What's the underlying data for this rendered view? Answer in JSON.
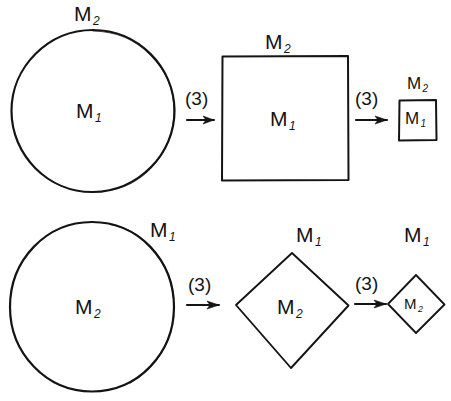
{
  "figure": {
    "type": "hand-drawn-shape-transformation-diagram",
    "background_color": "#ffffff",
    "ink_color": "#141414",
    "width": 451,
    "height": 401
  },
  "rows": [
    {
      "id": "row-1",
      "nodes": [
        {
          "shape": "circle",
          "size": "large",
          "inner_label_base": "M",
          "inner_label_sub": "1",
          "outer_label_base": "M",
          "outer_label_sub": "2",
          "outer_label_position": "top"
        },
        {
          "shape": "square",
          "size": "large",
          "inner_label_base": "M",
          "inner_label_sub": "1",
          "outer_label_base": "M",
          "outer_label_sub": "2",
          "outer_label_position": "top"
        },
        {
          "shape": "square",
          "size": "small",
          "inner_label_base": "M",
          "inner_label_sub": "1",
          "outer_label_base": "M",
          "outer_label_sub": "2",
          "outer_label_position": "top"
        }
      ],
      "arrows": [
        {
          "label": "(3)"
        },
        {
          "label": "(3)"
        }
      ]
    },
    {
      "id": "row-2",
      "nodes": [
        {
          "shape": "circle",
          "size": "large",
          "inner_label_base": "M",
          "inner_label_sub": "2",
          "outer_label_base": "M",
          "outer_label_sub": "1",
          "outer_label_position": "top-right"
        },
        {
          "shape": "diamond",
          "size": "large",
          "inner_label_base": "M",
          "inner_label_sub": "2",
          "outer_label_base": "M",
          "outer_label_sub": "1",
          "outer_label_position": "top"
        },
        {
          "shape": "diamond",
          "size": "small",
          "inner_label_base": "M",
          "inner_label_sub": "2",
          "outer_label_base": "M",
          "outer_label_sub": "1",
          "outer_label_position": "top"
        }
      ],
      "arrows": [
        {
          "label": "(3)"
        },
        {
          "label": "(3)"
        }
      ]
    }
  ],
  "labels": {
    "r1_circle_outer_base": "M",
    "r1_circle_outer_sub": "2",
    "r1_circle_inner_base": "M",
    "r1_circle_inner_sub": "1",
    "r1_square_outer_base": "M",
    "r1_square_outer_sub": "2",
    "r1_square_inner_base": "M",
    "r1_square_inner_sub": "1",
    "r1_smallsquare_outer_base": "M",
    "r1_smallsquare_outer_sub": "2",
    "r1_smallsquare_inner_base": "M",
    "r1_smallsquare_inner_sub": "1",
    "r2_circle_outer_base": "M",
    "r2_circle_outer_sub": "1",
    "r2_circle_inner_base": "M",
    "r2_circle_inner_sub": "2",
    "r2_diamond_outer_base": "M",
    "r2_diamond_outer_sub": "1",
    "r2_diamond_inner_base": "M",
    "r2_diamond_inner_sub": "2",
    "r2_smalldiamond_outer_base": "M",
    "r2_smalldiamond_outer_sub": "1",
    "r2_smalldiamond_inner_base": "M",
    "r2_smalldiamond_inner_sub": "2",
    "arrow_r1_1": "(3)",
    "arrow_r1_2": "(3)",
    "arrow_r2_1": "(3)",
    "arrow_r2_2": "(3)"
  }
}
